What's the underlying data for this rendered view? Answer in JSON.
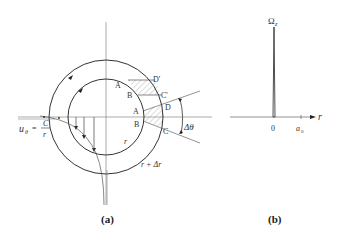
{
  "panel_a": {
    "caption": "(a)",
    "labels": {
      "A_top": "A",
      "B_top": "B",
      "D_prime": "D'",
      "C_prime": "C'",
      "A_mid": "A",
      "B_mid": "B",
      "D": "D",
      "C": "C",
      "delta_theta": "Δθ",
      "r": "r",
      "r_plus_dr": "r + Δr",
      "u_theta_lhs": "u",
      "u_theta_sub": "θ",
      "u_theta_eq": "=",
      "u_theta_num": "C",
      "u_theta_den": "r"
    }
  },
  "panel_b": {
    "caption": "(b)",
    "labels": {
      "omega": "Ω",
      "omega_sub": "z",
      "r_axis": "r",
      "zero": "0",
      "a0": "a",
      "a0_sub": "0"
    }
  },
  "colors": {
    "line": "#333333",
    "axis": "#777777",
    "hatch": "#999999"
  }
}
